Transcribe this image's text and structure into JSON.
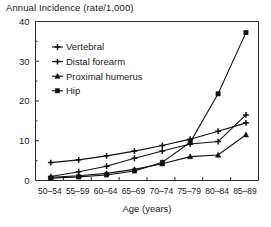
{
  "chart_data": {
    "type": "line",
    "title": "Annual Incidence (rate/1,000)",
    "xlabel": "Age (years)",
    "ylabel": "",
    "categories": [
      "50–54",
      "55–59",
      "60–64",
      "65–69",
      "70–74",
      "75–79",
      "80–84",
      "85–89"
    ],
    "ylim": [
      0,
      40
    ],
    "yticks": [
      0,
      10,
      20,
      30,
      40
    ],
    "yticks_minor": [
      5,
      15,
      25,
      35
    ],
    "grid": false,
    "legend_position": "upper-left-inside",
    "series": [
      {
        "name": "Vertebral",
        "marker": "plus",
        "values": [
          4.5,
          5.2,
          6.2,
          7.4,
          8.8,
          10.4,
          12.4,
          14.5
        ]
      },
      {
        "name": "Distal forearm",
        "marker": "plus",
        "values": [
          1.0,
          2.2,
          3.6,
          5.6,
          7.4,
          9.2,
          9.8,
          16.5
        ]
      },
      {
        "name": "Proximal humerus",
        "marker": "triangle",
        "values": [
          0.8,
          1.2,
          1.8,
          2.8,
          4.2,
          6.0,
          6.4,
          11.5
        ]
      },
      {
        "name": "Hip",
        "marker": "square",
        "values": [
          0.6,
          0.9,
          1.4,
          2.4,
          4.6,
          9.6,
          21.8,
          37.2
        ]
      }
    ]
  },
  "axes": {
    "ytick_labels": [
      "0",
      "10",
      "20",
      "30",
      "40"
    ]
  }
}
